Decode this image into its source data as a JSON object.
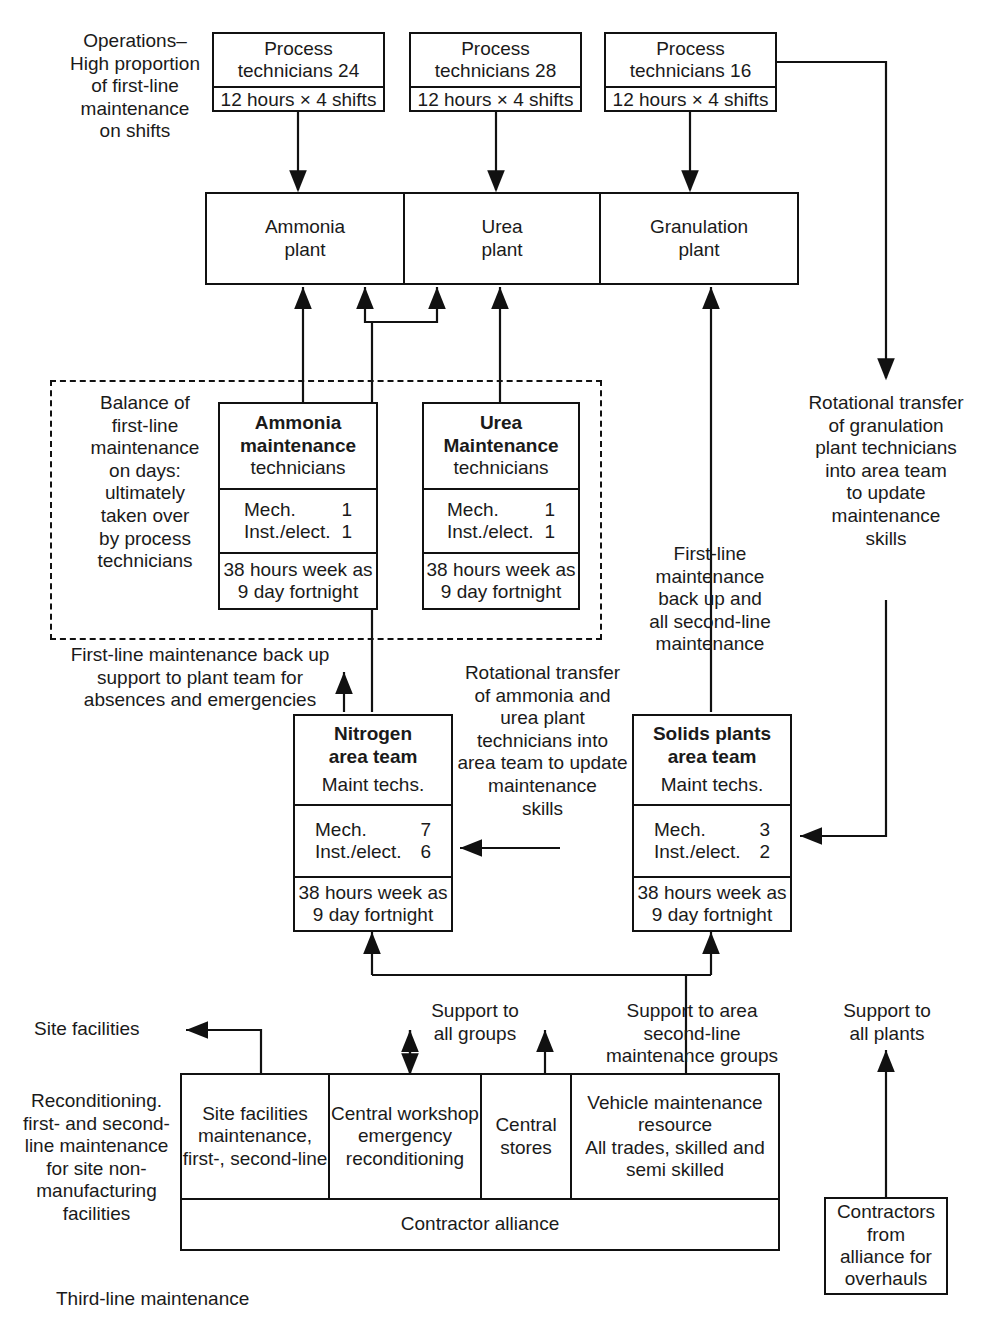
{
  "diagram": {
    "caption": "Third-line maintenance",
    "colors": {
      "line": "#111111",
      "text": "#1a1a1a",
      "background": "#ffffff"
    }
  },
  "operations": {
    "note": [
      "Operations–",
      "High proportion",
      "of first-line",
      "maintenance",
      "on shifts"
    ],
    "shift_boxes": [
      {
        "title_line1": "Process",
        "title_line2": "technicians 24",
        "hours": "12 hours × 4 shifts"
      },
      {
        "title_line1": "Process",
        "title_line2": "technicians 28",
        "hours": "12 hours × 4 shifts"
      },
      {
        "title_line1": "Process",
        "title_line2": "technicians 16",
        "hours": "12 hours × 4 shifts"
      }
    ]
  },
  "plants": [
    {
      "line1": "Ammonia",
      "line2": "plant"
    },
    {
      "line1": "Urea",
      "line2": "plant"
    },
    {
      "line1": "Granulation",
      "line2": "plant"
    }
  ],
  "first_line_group": {
    "note": [
      "Balance of",
      "first-line",
      "maintenance",
      "on days:",
      "ultimately",
      "taken over",
      "by process",
      "technicians"
    ],
    "teams": [
      {
        "title1": "Ammonia",
        "title2": "maintenance",
        "title3": "technicians",
        "mech_label": "Mech.",
        "mech_value": "1",
        "inst_label": "Inst./elect.",
        "inst_value": "1",
        "hours1": "38 hours week as",
        "hours2": "9 day fortnight"
      },
      {
        "title1": "Urea",
        "title2": "Maintenance",
        "title3": "technicians",
        "mech_label": "Mech.",
        "mech_value": "1",
        "inst_label": "Inst./elect.",
        "inst_value": "1",
        "hours1": "38 hours week as",
        "hours2": "9 day fortnight"
      }
    ]
  },
  "area_teams": [
    {
      "title1": "Nitrogen",
      "title2": "area team",
      "subtitle": "Maint techs.",
      "mech_label": "Mech.",
      "mech_value": "7",
      "inst_label": "Inst./elect.",
      "inst_value": "6",
      "hours1": "38 hours week as",
      "hours2": "9 day fortnight"
    },
    {
      "title1": "Solids plants",
      "title2": "area team",
      "subtitle": "Maint techs.",
      "mech_label": "Mech.",
      "mech_value": "3",
      "inst_label": "Inst./elect.",
      "inst_value": "2",
      "hours1": "38 hours week as",
      "hours2": "9 day fortnight"
    }
  ],
  "annotations": {
    "granulation_rotation": [
      "Rotational transfer",
      "of granulation",
      "plant technicians",
      "into area team",
      "to update",
      "maintenance",
      "skills"
    ],
    "second_line": [
      "First-line",
      "maintenance",
      "back up and",
      "all second-line",
      "maintenance"
    ],
    "backup_support": [
      "First-line maintenance back up",
      "support to plant team for",
      "absences and emergencies"
    ],
    "ammonia_urea_rotation": [
      "Rotational transfer",
      "of ammonia and",
      "urea plant",
      "technicians into",
      "area team to update",
      "maintenance",
      "skills"
    ],
    "support_all_groups": [
      "Support to",
      "all groups"
    ],
    "support_area_second_line": [
      "Support to area",
      "second-line",
      "maintenance groups"
    ],
    "support_all_plants": [
      "Support to",
      "all plants"
    ],
    "site_facilities_label": "Site facilities",
    "reconditioning": [
      "Reconditioning.",
      "first- and second-",
      "line maintenance",
      "for site non-",
      "manufacturing",
      "facilities"
    ]
  },
  "third_line": {
    "cells": [
      {
        "lines": [
          "Site facilities",
          "maintenance,",
          "first-, second-line"
        ]
      },
      {
        "lines": [
          "Central workshop",
          "emergency",
          "reconditioning"
        ]
      },
      {
        "lines": [
          "Central",
          "stores"
        ]
      },
      {
        "lines": [
          "Vehicle maintenance",
          "resource",
          "All trades, skilled and",
          "semi skilled"
        ]
      }
    ],
    "footer": "Contractor alliance"
  },
  "contractors_box": {
    "lines": [
      "Contractors",
      "from",
      "alliance for",
      "overhauls"
    ]
  }
}
